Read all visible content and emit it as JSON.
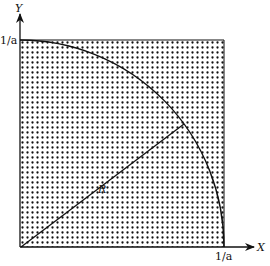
{
  "diagram": {
    "axes": {
      "x_label": "X",
      "y_label": "Y",
      "x_tick": "1/a",
      "y_tick": "1/a"
    },
    "radius_label": "R",
    "shapes": [
      "dotted square of side 1/a",
      "quarter circle arc of radius R",
      "radius line from origin"
    ],
    "colors": {
      "ink": "#111111",
      "background": "#ffffff"
    }
  }
}
